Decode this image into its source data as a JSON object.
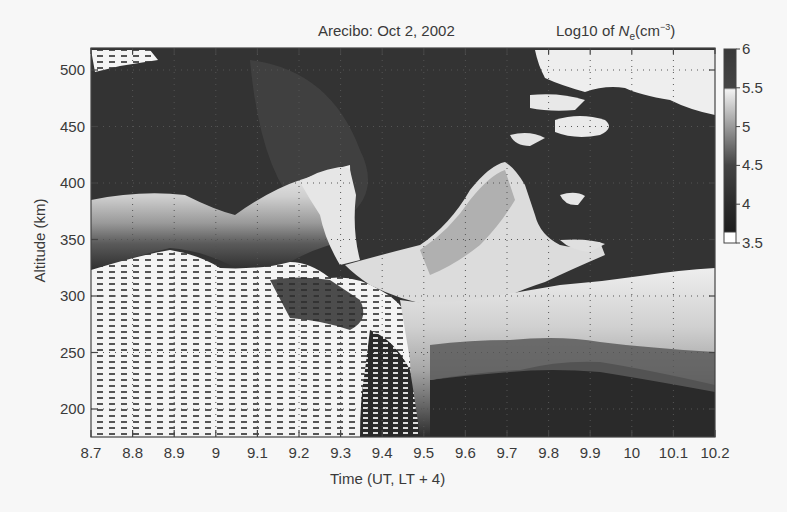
{
  "chart_data": {
    "type": "heatmap",
    "title": "Arecibo: Oct 2, 2002",
    "colorbar_title": "Log10 of Ne(cm^-3)",
    "colorbar_title_parts": {
      "prefix": "Log10 of ",
      "var": "N",
      "sub": "e",
      "unit_open": "(cm",
      "sup": "−3",
      "unit_close": ")"
    },
    "xlabel": "Time (UT, LT + 4)",
    "ylabel": "Altitude (km)",
    "xlim": [
      8.7,
      10.2
    ],
    "ylim": [
      180,
      520
    ],
    "x_ticks": [
      "8.7",
      "8.8",
      "8.9",
      "9",
      "9.1",
      "9.2",
      "9.3",
      "9.4",
      "9.5",
      "9.6",
      "9.7",
      "9.8",
      "9.9",
      "10",
      "10.1",
      "10.2"
    ],
    "y_ticks": [
      "200",
      "250",
      "300",
      "350",
      "400",
      "450",
      "500"
    ],
    "grid": "dotted",
    "colormap": "grayscale (dark = high density, white = low density)",
    "colorbar": {
      "range": [
        3.5,
        6
      ],
      "ticks": [
        "6",
        "5.5",
        "5",
        "4.5",
        "4",
        "3.5"
      ],
      "position": "right"
    },
    "regions": [
      {
        "name": "dense-F-region-upper",
        "description": "Dark (Ne≈5.5–6) background covering most altitudes above ~380 km from 8.7–9.5 UT and above ~300 km from 9.8–10.2 UT"
      },
      {
        "name": "bottomside-gradient-early",
        "description": "Light/white band rising 330–390 km between 8.7 and 9.3 UT with a wavy structure"
      },
      {
        "name": "plume-9.25",
        "description": "Bright intrusion reaching ~410 km near 9.25–9.3 UT"
      },
      {
        "name": "plume-9.7",
        "description": "Bright uplift reaching ~420 km near 9.6–9.75 UT"
      },
      {
        "name": "low-density-bottom-early",
        "description": "Noisy white (Ne≈3.5) region below ~300 km from 8.7–9.5 UT"
      },
      {
        "name": "descending-layer-late",
        "description": "Layer descending to 200–260 km after 9.6 UT with gray banded gradient"
      },
      {
        "name": "upper-depletion-late",
        "description": "White patches near 440–510 km from 9.5–10.2 UT"
      }
    ]
  },
  "layout": {
    "plot": {
      "x0": 91,
      "x1": 715,
      "y0": 48,
      "y1": 437
    },
    "alt_to_y": {
      "a": 635,
      "b": -1.13
    },
    "colorbar": {
      "x": 724,
      "w": 12,
      "y0": 49,
      "y1": 243
    }
  }
}
